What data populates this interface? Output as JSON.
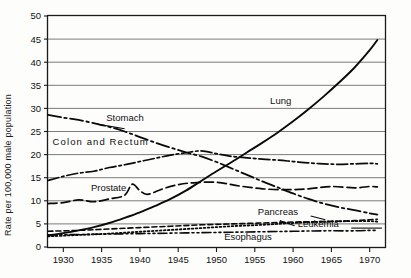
{
  "chart_data": {
    "type": "line",
    "title": "",
    "xlabel": "",
    "ylabel": "Rate per 100,000 male population",
    "xlim": [
      1928,
      1972
    ],
    "ylim": [
      0,
      50
    ],
    "grid": true,
    "legend_position": "inline-labels",
    "xticks": [
      "1930",
      "1935",
      "1940",
      "1945",
      "1950",
      "1955",
      "1960",
      "1965",
      "1970"
    ],
    "xtick_values": [
      1930,
      1935,
      1940,
      1945,
      1950,
      1955,
      1960,
      1965,
      1970
    ],
    "yticks": [
      "0",
      "5",
      "10",
      "15",
      "20",
      "25",
      "30",
      "35",
      "40",
      "45",
      "50"
    ],
    "ytick_values": [
      0,
      5,
      10,
      15,
      20,
      25,
      30,
      35,
      40,
      45,
      50
    ],
    "series": [
      {
        "name": "Lung",
        "label": "Lung",
        "style": "solid",
        "x": [
          1928,
          1930,
          1932,
          1934,
          1936,
          1938,
          1940,
          1942,
          1944,
          1946,
          1948,
          1950,
          1952,
          1954,
          1956,
          1958,
          1960,
          1962,
          1964,
          1966,
          1968,
          1970,
          1971
        ],
        "values": [
          2.5,
          3.0,
          3.6,
          4.3,
          5.2,
          6.3,
          7.5,
          8.9,
          10.4,
          12.2,
          14.3,
          16.4,
          18.4,
          20.5,
          22.6,
          24.8,
          27.2,
          29.8,
          32.6,
          35.6,
          38.8,
          42.6,
          44.8
        ]
      },
      {
        "name": "Stomach",
        "label": "Stomach",
        "style": "dashdot-long",
        "x": [
          1928,
          1930,
          1932,
          1934,
          1936,
          1938,
          1940,
          1942,
          1944,
          1946,
          1948,
          1950,
          1952,
          1954,
          1956,
          1958,
          1960,
          1962,
          1964,
          1966,
          1968,
          1970,
          1971
        ],
        "values": [
          28.6,
          28.0,
          27.5,
          26.8,
          26.0,
          25.0,
          23.8,
          22.6,
          21.5,
          20.5,
          19.6,
          18.4,
          17.0,
          15.6,
          14.2,
          12.9,
          11.6,
          10.4,
          9.4,
          8.6,
          8.0,
          7.3,
          7.0
        ]
      },
      {
        "name": "Colon and Rectum",
        "label": "Colon and Rectum",
        "style": "dashdot",
        "x": [
          1928,
          1930,
          1932,
          1934,
          1936,
          1938,
          1940,
          1942,
          1944,
          1946,
          1948,
          1950,
          1952,
          1954,
          1956,
          1958,
          1960,
          1962,
          1964,
          1966,
          1968,
          1970,
          1971
        ],
        "values": [
          14.4,
          15.3,
          16.0,
          16.4,
          17.2,
          17.8,
          18.5,
          19.2,
          19.9,
          20.4,
          20.8,
          20.2,
          19.6,
          19.3,
          19.0,
          18.8,
          18.5,
          18.2,
          18.0,
          17.9,
          18.0,
          18.1,
          18.0
        ]
      },
      {
        "name": "Prostate",
        "label": "Prostate",
        "style": "dashed-long",
        "x": [
          1928,
          1930,
          1932,
          1934,
          1936,
          1938,
          1939,
          1940,
          1941,
          1943,
          1945,
          1947,
          1950,
          1953,
          1956,
          1959,
          1962,
          1965,
          1968,
          1970,
          1971
        ],
        "values": [
          9.4,
          9.6,
          10.2,
          9.8,
          10.4,
          11.2,
          13.6,
          12.2,
          11.4,
          12.6,
          13.5,
          13.9,
          14.0,
          13.2,
          12.6,
          12.4,
          12.6,
          13.1,
          12.8,
          13.1,
          13.0
        ]
      },
      {
        "name": "Pancreas",
        "label": "Pancreas",
        "style": "dashed-short",
        "x": [
          1928,
          1932,
          1936,
          1940,
          1944,
          1948,
          1952,
          1956,
          1960,
          1964,
          1968,
          1970,
          1971
        ],
        "values": [
          3.4,
          3.6,
          3.9,
          4.2,
          4.5,
          4.8,
          5.0,
          5.2,
          5.4,
          5.5,
          5.7,
          5.9,
          6.0
        ]
      },
      {
        "name": "Leukemia",
        "label": "Leukemia",
        "style": "dotted",
        "x": [
          1928,
          1932,
          1936,
          1940,
          1944,
          1948,
          1952,
          1956,
          1960,
          1964,
          1968,
          1970,
          1971
        ],
        "values": [
          2.3,
          2.6,
          2.9,
          3.3,
          3.7,
          4.1,
          4.5,
          4.8,
          5.2,
          5.5,
          5.6,
          5.6,
          5.5
        ]
      },
      {
        "name": "Esophagus",
        "label": "Esophagus",
        "style": "dashdotdot",
        "x": [
          1928,
          1932,
          1936,
          1940,
          1944,
          1948,
          1952,
          1956,
          1960,
          1964,
          1968,
          1970,
          1971
        ],
        "values": [
          2.6,
          2.7,
          2.8,
          2.9,
          3.0,
          3.1,
          3.2,
          3.3,
          3.4,
          3.5,
          3.5,
          3.6,
          3.6
        ]
      }
    ],
    "annotations": [
      {
        "name": "lung-label",
        "text": "Lung",
        "x": 1957.0,
        "y": 31.0
      },
      {
        "name": "stomach-label",
        "text": "Stomach",
        "x": 1935.6,
        "y": 27.3
      },
      {
        "name": "colon-label",
        "text": "Colon and Rectum",
        "x": 1928.6,
        "y": 22.1
      },
      {
        "name": "prostate-label",
        "text": "Prostate",
        "x": 1933.6,
        "y": 12.2
      },
      {
        "name": "pancreas-label",
        "text": "Pancreas",
        "x": 1955.4,
        "y": 7.0
      },
      {
        "name": "leukemia-label",
        "text": "Leukemia",
        "x": 1960.6,
        "y": 4.4
      },
      {
        "name": "esophagus-label",
        "text": "Esophagus",
        "x": 1951.0,
        "y": 1.6
      }
    ]
  },
  "colors": {
    "ink": "#0a0a0a",
    "grid": "#6d6d6d",
    "background": "#fdfdfc"
  }
}
